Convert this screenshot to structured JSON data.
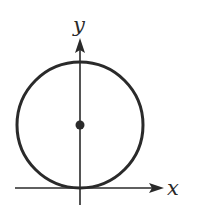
{
  "diagram": {
    "axes": {
      "x_label": "x",
      "y_label": "y"
    },
    "circle": {
      "center_marked": true,
      "tangent_to": "x-axis at origin"
    },
    "colors": {
      "stroke": "#2a2a2a",
      "background": "#ffffff"
    }
  }
}
